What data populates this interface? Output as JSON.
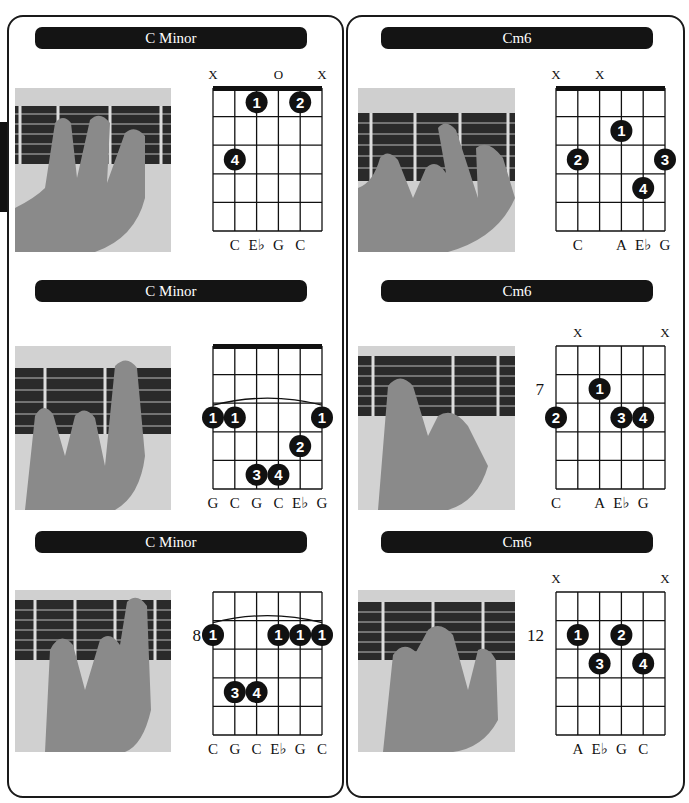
{
  "left_column": {
    "sections": [
      {
        "title": "C Minor",
        "diagram": {
          "nut": true,
          "fret_label": "",
          "string_markers": [
            "X",
            "",
            "",
            "O",
            "",
            "X"
          ],
          "barre": null,
          "fingers": [
            {
              "finger": "1",
              "string": 3,
              "row": 1
            },
            {
              "finger": "2",
              "string": 5,
              "row": 1
            },
            {
              "finger": "4",
              "string": 2,
              "row": 3
            }
          ],
          "notes": [
            "",
            "C",
            "E♭",
            "G",
            "C",
            ""
          ]
        }
      },
      {
        "title": "C Minor",
        "diagram": {
          "nut": true,
          "fret_label": "",
          "string_markers": [
            "",
            "",
            "",
            "",
            "",
            ""
          ],
          "barre": {
            "row": 3,
            "from": 1,
            "to": 6
          },
          "fingers": [
            {
              "finger": "1",
              "string": 1,
              "row": 3
            },
            {
              "finger": "1",
              "string": 2,
              "row": 3
            },
            {
              "finger": "1",
              "string": 6,
              "row": 3
            },
            {
              "finger": "2",
              "string": 5,
              "row": 4
            },
            {
              "finger": "3",
              "string": 3,
              "row": 5
            },
            {
              "finger": "4",
              "string": 4,
              "row": 5
            }
          ],
          "notes": [
            "G",
            "C",
            "G",
            "C",
            "E♭",
            "G"
          ]
        }
      },
      {
        "title": "C Minor",
        "diagram": {
          "nut": false,
          "fret_label": "8",
          "fret_label_row": 2,
          "string_markers": [
            "",
            "",
            "",
            "",
            "",
            ""
          ],
          "barre": {
            "row": 2,
            "from": 1,
            "to": 6
          },
          "fingers": [
            {
              "finger": "1",
              "string": 1,
              "row": 2
            },
            {
              "finger": "1",
              "string": 4,
              "row": 2
            },
            {
              "finger": "1",
              "string": 5,
              "row": 2
            },
            {
              "finger": "1",
              "string": 6,
              "row": 2
            },
            {
              "finger": "3",
              "string": 2,
              "row": 4
            },
            {
              "finger": "4",
              "string": 3,
              "row": 4
            }
          ],
          "notes": [
            "C",
            "G",
            "C",
            "E♭",
            "G",
            "C"
          ]
        }
      }
    ]
  },
  "right_column": {
    "sections": [
      {
        "title": "Cm6",
        "diagram": {
          "nut": true,
          "fret_label": "",
          "string_markers": [
            "X",
            "",
            "X",
            "",
            "",
            ""
          ],
          "barre": null,
          "fingers": [
            {
              "finger": "1",
              "string": 4,
              "row": 2
            },
            {
              "finger": "2",
              "string": 2,
              "row": 3
            },
            {
              "finger": "3",
              "string": 6,
              "row": 3
            },
            {
              "finger": "4",
              "string": 5,
              "row": 4
            }
          ],
          "notes": [
            "",
            "C",
            "",
            "A",
            "E♭",
            "G"
          ]
        }
      },
      {
        "title": "Cm6",
        "diagram": {
          "nut": false,
          "fret_label": "7",
          "fret_label_row": 2,
          "string_markers": [
            "",
            "X",
            "",
            "",
            "",
            "X"
          ],
          "barre": null,
          "fingers": [
            {
              "finger": "1",
              "string": 3,
              "row": 2
            },
            {
              "finger": "2",
              "string": 1,
              "row": 3
            },
            {
              "finger": "3",
              "string": 4,
              "row": 3
            },
            {
              "finger": "4",
              "string": 5,
              "row": 3
            }
          ],
          "notes": [
            "C",
            "",
            "A",
            "E♭",
            "G",
            ""
          ]
        }
      },
      {
        "title": "Cm6",
        "diagram": {
          "nut": false,
          "fret_label": "12",
          "fret_label_row": 2,
          "string_markers": [
            "X",
            "",
            "",
            "",
            "",
            "X"
          ],
          "barre": null,
          "fingers": [
            {
              "finger": "1",
              "string": 2,
              "row": 2
            },
            {
              "finger": "2",
              "string": 4,
              "row": 2
            },
            {
              "finger": "3",
              "string": 3,
              "row": 3
            },
            {
              "finger": "4",
              "string": 5,
              "row": 3
            }
          ],
          "notes": [
            "",
            "A",
            "E♭",
            "G",
            "C",
            ""
          ]
        }
      }
    ]
  },
  "colors": {
    "ink": "#111111",
    "title_bar": "#141414",
    "title_text": "#ffffff",
    "finger_dot": "#111111",
    "photo_bg": "#d8d8d8",
    "fretboard": "#2a2a2a",
    "hand": "#8a8a8a"
  }
}
